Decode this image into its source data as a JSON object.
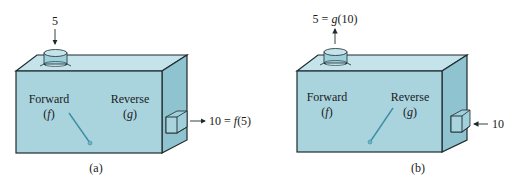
{
  "colors": {
    "front": "#a9d4de",
    "top": "#c4e3ea",
    "side": "#8ec3cf",
    "edge": "#1f2a2e",
    "needle": "#3d8ea3",
    "pipe": "#9fd0dc"
  },
  "panels": [
    {
      "id": "a",
      "caption": "(a)",
      "forward_label": "Forward",
      "forward_symbol": "(f)",
      "reverse_label": "Reverse",
      "reverse_symbol": "(g)",
      "top_label": "5",
      "top_arrow": "down",
      "side_label": "10 = f(5)",
      "side_arrow": "right",
      "needle_points_to": "forward"
    },
    {
      "id": "b",
      "caption": "(b)",
      "forward_label": "Forward",
      "forward_symbol": "(f)",
      "reverse_label": "Reverse",
      "reverse_symbol": "(g)",
      "top_label": "5 = g(10)",
      "top_arrow": "up",
      "side_label": "10",
      "side_arrow": "left",
      "needle_points_to": "reverse"
    }
  ]
}
